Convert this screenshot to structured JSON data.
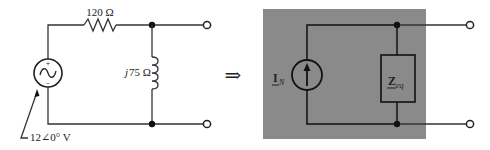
{
  "original_circuit": {
    "resistor": {
      "label": "120 Ω"
    },
    "inductor": {
      "label_italic": "j",
      "label_value": "75 Ω"
    },
    "source": {
      "label": "12∠0° V",
      "plus": "+",
      "minus": "−",
      "type": "ac-voltage-source"
    }
  },
  "transform_arrow": "⇒",
  "norton_equivalent": {
    "current_source": {
      "label_main": "I",
      "label_sub": "N"
    },
    "impedance": {
      "label_main": "Z",
      "label_sub": "eq"
    },
    "background_color": "#8a8a8a"
  }
}
